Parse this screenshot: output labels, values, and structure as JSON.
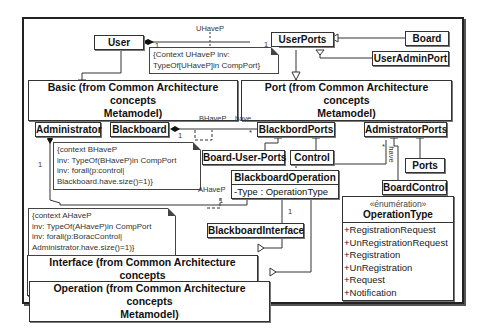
{
  "diagram": {
    "type": "UML class diagram",
    "classes": {
      "user": "User",
      "user_ports": "UserPorts",
      "board": "Board",
      "user_admin_port": "UserAdminPort",
      "administrator": "Administrator",
      "blackboard": "Blackboard",
      "blackbord_ports": "BlackbordPorts",
      "admistrator_ports": "AdmistratorPorts",
      "board_user_ports": "Board-User-Ports",
      "control": "Control",
      "ports": "Ports",
      "board_control": "BoardControl",
      "blackboard_operation": "BlackboardOperation",
      "blackboard_operation_attr": "-Type : OperationType",
      "blackboard_interface": "BlackboardInterface"
    },
    "packages": {
      "basic_line1": "Basic (from Common Architecture concepts",
      "basic_line2": "Metamodel)",
      "port_line1": "Port  (from Common Architecture concepts",
      "port_line2": "Metamodel)",
      "interface_line1": "Interface  (from Common Architecture concepts",
      "interface_line2": "Metamodel)",
      "operation_line1": "Operation  (from Common Architecture concepts",
      "operation_line2": "Metamodel)"
    },
    "notes": {
      "uhavep": [
        "{Context UHaveP inv:",
        "TypeOf[UHaveP]in CompPort}"
      ],
      "bhavep": [
        "{context BHaveP",
        "inv: TypeOf(BHaveP)in CompPort",
        "inv: forall(p:control|",
        "Blackboard.have.size()=1)}"
      ],
      "ahavep": [
        "{context AHaveP",
        "inv: TypeOf(AHaveP)in CompPort",
        "inv: forall(p:BoracControl|",
        "Administrator.have.size()=1)}"
      ]
    },
    "labels": {
      "uhavep": "UHaveP",
      "bhavep": "BHaveP",
      "ahavep": "AHaveP",
      "have1": "have",
      "have2": "have",
      "one_a": "1",
      "one_b": "1",
      "one_c": "1",
      "one_d": "1",
      "one_e": "1",
      "one_f": "1",
      "star_a": "*",
      "star_b": "*"
    },
    "enumeration": {
      "stereotype": "«énumération»",
      "name": "OperationType",
      "literals": [
        "+RegistrationRequest",
        "+UnRegistrationRequest",
        "+Registration",
        "+UnRegistration",
        "+Request",
        "+Notification"
      ]
    }
  }
}
